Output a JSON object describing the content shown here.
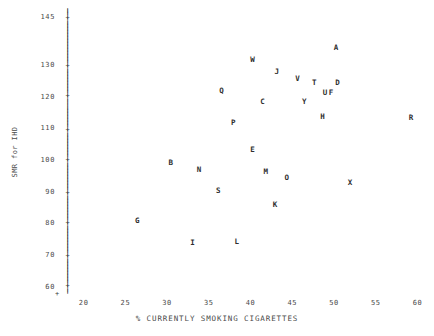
{
  "chart_data": {
    "type": "scatter",
    "title": "",
    "xlabel": "% CURRENTLY SMOKING CIGARETTES",
    "ylabel": "SMR for IHD",
    "xlim": [
      18.0,
      61.5
    ],
    "ylim": [
      58.0,
      147.0
    ],
    "grid": false,
    "legend": "none",
    "xticks": [
      "20",
      "25",
      "30",
      "35",
      "40",
      "45",
      "50",
      "55",
      "60"
    ],
    "xtick_values": [
      20,
      25,
      30,
      35,
      40,
      45,
      50,
      55,
      60
    ],
    "yticks": [
      "145",
      "130",
      "120",
      "110",
      "100",
      "90",
      "80",
      "70",
      "60"
    ],
    "ytick_values": [
      145,
      130,
      120,
      110,
      100,
      90,
      80,
      70,
      60
    ],
    "point_label_style": "letter-marker",
    "points": [
      {
        "label": "A",
        "x": 50.2,
        "y": 135.5
      },
      {
        "label": "W",
        "x": 40.2,
        "y": 132.0
      },
      {
        "label": "J",
        "x": 43.1,
        "y": 128.0
      },
      {
        "label": "V",
        "x": 45.6,
        "y": 126.0
      },
      {
        "label": "T",
        "x": 47.6,
        "y": 124.5
      },
      {
        "label": "D",
        "x": 50.4,
        "y": 124.5
      },
      {
        "label": "Q",
        "x": 36.5,
        "y": 122.0
      },
      {
        "label": "U",
        "x": 48.9,
        "y": 121.5
      },
      {
        "label": "F",
        "x": 49.6,
        "y": 121.5
      },
      {
        "label": "C",
        "x": 41.4,
        "y": 118.5
      },
      {
        "label": "Y",
        "x": 46.4,
        "y": 118.5
      },
      {
        "label": "H",
        "x": 48.6,
        "y": 114.0
      },
      {
        "label": "R",
        "x": 59.2,
        "y": 113.5
      },
      {
        "label": "P",
        "x": 37.9,
        "y": 112.0
      },
      {
        "label": "E",
        "x": 40.2,
        "y": 103.5
      },
      {
        "label": "B",
        "x": 30.4,
        "y": 99.5
      },
      {
        "label": "N",
        "x": 33.8,
        "y": 97.0
      },
      {
        "label": "M",
        "x": 41.8,
        "y": 96.5
      },
      {
        "label": "O",
        "x": 44.3,
        "y": 94.5
      },
      {
        "label": "X",
        "x": 51.9,
        "y": 93.0
      },
      {
        "label": "S",
        "x": 36.1,
        "y": 90.5
      },
      {
        "label": "K",
        "x": 42.9,
        "y": 86.0
      },
      {
        "label": "G",
        "x": 26.4,
        "y": 81.0
      },
      {
        "label": "I",
        "x": 33.0,
        "y": 74.0
      },
      {
        "label": "L",
        "x": 38.3,
        "y": 74.5
      }
    ]
  },
  "axes": {
    "vertical_glyph_tick": "+",
    "vertical_glyph_fill": "|",
    "horizontal_glyph_tick": "+",
    "horizontal_glyph_fill": "-"
  }
}
